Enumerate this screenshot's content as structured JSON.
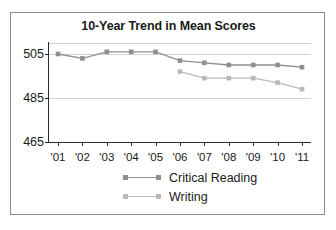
{
  "chart_data": {
    "type": "line",
    "title": "10-Year Trend in Mean Scores",
    "xlabel": "",
    "ylabel": "",
    "categories": [
      "'01",
      "'02",
      "'03",
      "'04",
      "'05",
      "'06",
      "'07",
      "'08",
      "'09",
      "'10",
      "'11"
    ],
    "ylim": [
      465,
      510
    ],
    "yticks": [
      465,
      485,
      505
    ],
    "ytick_labels": [
      "465",
      "485",
      "505"
    ],
    "grid": "horizontal",
    "legend_position": "bottom",
    "series": [
      {
        "name": "Critical Reading",
        "color": "#8f8f8f",
        "values": [
          505,
          503,
          506,
          506,
          506,
          502,
          501,
          500,
          500,
          500,
          499
        ]
      },
      {
        "name": "Writing",
        "color": "#b9b9b9",
        "values": [
          null,
          null,
          null,
          null,
          null,
          497,
          494,
          494,
          494,
          492,
          489
        ]
      }
    ]
  },
  "figure": {
    "border_color": "#8c8c8c",
    "background": "#ffffff",
    "gridline_color": "#d2d2d2",
    "axis_color": "#2b2b2b"
  }
}
